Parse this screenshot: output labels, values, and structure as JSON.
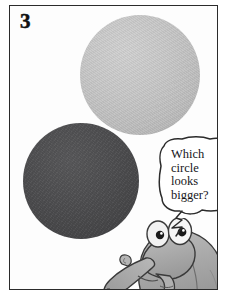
{
  "panel": {
    "number": "3",
    "background_color": "#ffffff",
    "frame_color": "#2b2b2b"
  },
  "shapes": [
    {
      "name": "light-circle",
      "label": "light gray circle",
      "fill_color": "#c6c6c6",
      "diameter_px": 120,
      "center_x": 130,
      "center_y": 74
    },
    {
      "name": "dark-circle",
      "label": "dark gray circle",
      "fill_color": "#4a4a4c",
      "diameter_px": 116,
      "center_x": 80,
      "center_y": 180
    }
  ],
  "speech_bubble": {
    "text": "Which\ncircle\nlooks\nbigger?",
    "outline_color": "#2b2b2b",
    "fill_color": "#ffffff"
  },
  "character": {
    "name": "anteater-creature",
    "body_color": "#a8a8a8",
    "outline_color": "#3a3a3a",
    "eye_color": "#ffffff",
    "pupil_color": "#1a1a1a"
  }
}
